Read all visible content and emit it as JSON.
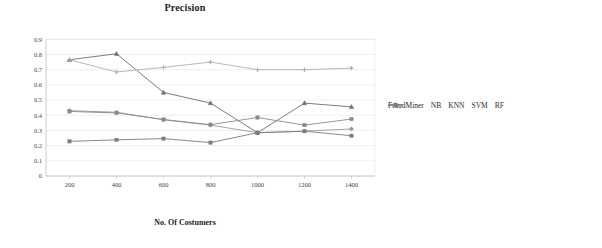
{
  "chart_data": {
    "type": "line",
    "title": "Precision",
    "xlabel": "No. Of Costumers",
    "ylabel": "",
    "categories": [
      200,
      400,
      600,
      800,
      1000,
      1200,
      1400
    ],
    "xtick_labels": [
      "200",
      "400",
      "600",
      "800",
      "1000",
      "1200",
      "1400"
    ],
    "ytick_labels": [
      "0",
      "0.1",
      "0.2",
      "0.3",
      "0.4",
      "0.5",
      "0.6",
      "0.7",
      "0.8",
      "0.9"
    ],
    "ytick_values": [
      0,
      0.1,
      0.2,
      0.3,
      0.4,
      0.5,
      0.6,
      0.7,
      0.8,
      0.9
    ],
    "ylim": [
      0,
      0.9
    ],
    "grid": true,
    "legend_position": "right",
    "series": [
      {
        "name": "FraudMiner",
        "color": "#9a9a9a",
        "marker": "diamond",
        "values": [
          0.43,
          0.42,
          0.37,
          0.335,
          0.285,
          0.295,
          0.31
        ]
      },
      {
        "name": "NB",
        "color": "#6e6e6e",
        "marker": "triangle",
        "values": [
          0.765,
          0.805,
          0.55,
          0.48,
          0.285,
          0.48,
          0.455
        ]
      },
      {
        "name": "KNN",
        "color": "#b0b0b0",
        "marker": "cross",
        "values": [
          0.765,
          0.685,
          0.715,
          0.75,
          0.7,
          0.7,
          0.71
        ]
      },
      {
        "name": "SVM",
        "color": "#8a8a8a",
        "marker": "square",
        "values": [
          0.425,
          0.415,
          0.372,
          0.338,
          0.385,
          0.335,
          0.375
        ]
      },
      {
        "name": "RF",
        "color": "#7d7d7d",
        "marker": "square",
        "values": [
          0.228,
          0.238,
          0.246,
          0.22,
          0.285,
          0.295,
          0.265
        ]
      }
    ]
  },
  "legend": {
    "items": [
      {
        "label": "FraudMiner"
      },
      {
        "label": "NB"
      },
      {
        "label": "KNN"
      },
      {
        "label": "SVM"
      },
      {
        "label": "RF"
      }
    ]
  },
  "colors": {
    "axis": "#bfbfbf",
    "grid": "#e4e4e4",
    "text": "#2b2b2b",
    "background": "#ffffff"
  }
}
